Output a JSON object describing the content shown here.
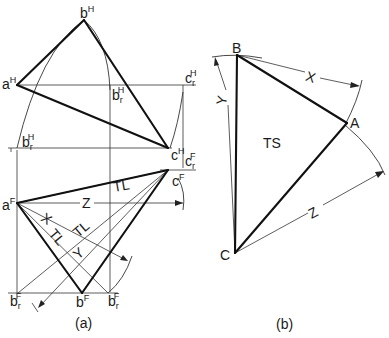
{
  "figure": {
    "panel_a": {
      "caption": "(a)",
      "horizontal_view": {
        "points": {
          "a": {
            "base": "a",
            "sup": "H"
          },
          "b": {
            "base": "b",
            "sup": "H"
          },
          "c": {
            "base": "c",
            "sup": "H"
          },
          "br": {
            "base": "b",
            "sub": "r",
            "sup": "H"
          },
          "br2": {
            "base": "b",
            "sub": "r",
            "sup": "H"
          },
          "cr": {
            "base": "c",
            "sub": "r",
            "sup": "H"
          }
        }
      },
      "frontal_view": {
        "points": {
          "a": {
            "base": "a",
            "sup": "F"
          },
          "b": {
            "base": "b",
            "sup": "F"
          },
          "c": {
            "base": "c",
            "sup": "F"
          },
          "cr": {
            "base": "c",
            "sub": "r",
            "sup": "F"
          },
          "br_left": {
            "base": "b",
            "sub": "r",
            "sup": "F"
          },
          "br_right": {
            "base": "b",
            "sub": "r",
            "sup": "F"
          }
        },
        "dimension_labels": {
          "z": "Z",
          "x": "X",
          "y": "Y",
          "tl_top": "TL",
          "tl_mid": "TL",
          "tl_left": "TL"
        }
      }
    },
    "panel_b": {
      "caption": "(b)",
      "vertices": {
        "a": "A",
        "b": "B",
        "c": "C"
      },
      "face_label": "TS",
      "dimension_labels": {
        "x": "X",
        "y": "Y",
        "z": "Z"
      }
    }
  }
}
